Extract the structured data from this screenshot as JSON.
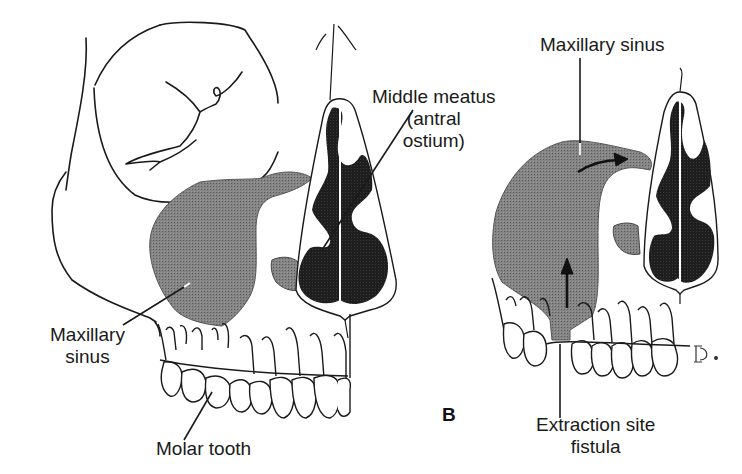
{
  "figure": {
    "panel_letter": "B",
    "colors": {
      "sinus_fill": "#7c7c7c",
      "nasal_cavity_fill": "#1c1c1c",
      "line": "#1a1a1a",
      "background": "#ffffff"
    },
    "left_panel": {
      "description": "Lateral-oblique skull with maxillary sinus and upper dentition",
      "labels": {
        "middle_meatus_line1": "Middle meatus",
        "middle_meatus_line2": "(antral",
        "middle_meatus_line3": "ostium)",
        "maxillary_sinus_line1": "Maxillary",
        "maxillary_sinus_line2": "sinus",
        "molar_tooth": "Molar tooth"
      }
    },
    "right_panel": {
      "description": "Maxillary sinus with oroantral fistula after extraction; arrows show drainage",
      "labels": {
        "maxillary_sinus": "Maxillary sinus",
        "extraction_line1": "Extraction site",
        "extraction_line2": "fistula"
      },
      "signature": "Ꭰ."
    }
  }
}
